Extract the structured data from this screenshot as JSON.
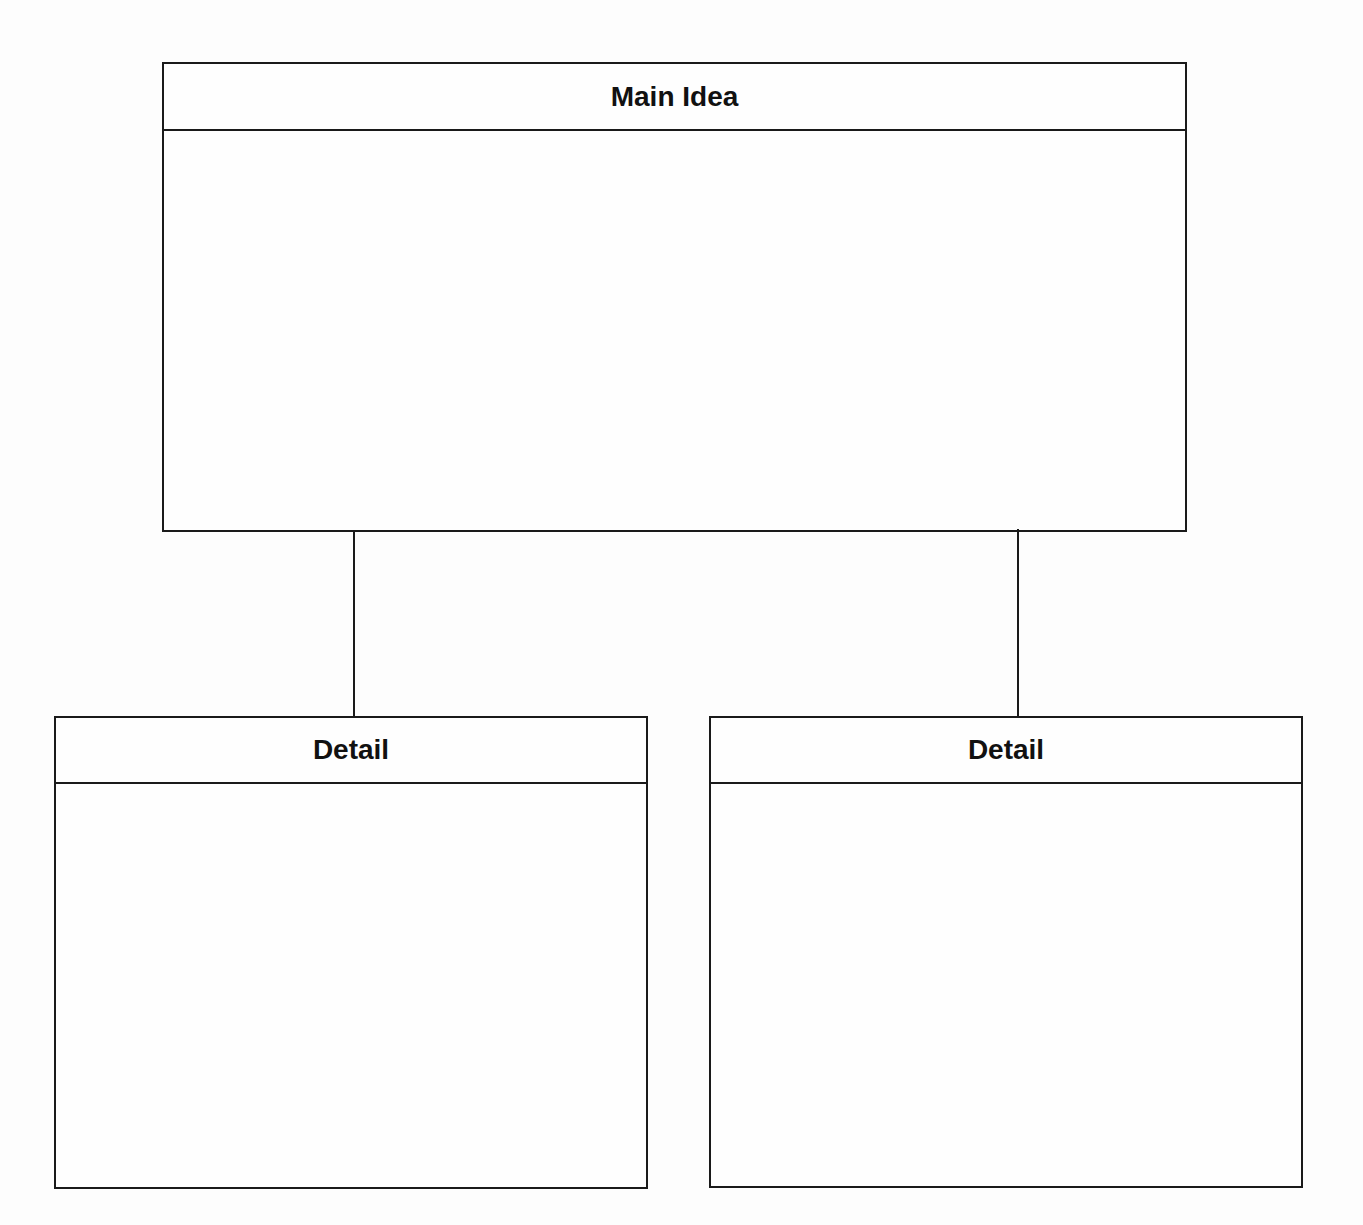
{
  "diagram": {
    "type": "hierarchy",
    "main": {
      "title": "Main Idea",
      "body": ""
    },
    "details": [
      {
        "title": "Detail",
        "body": ""
      },
      {
        "title": "Detail",
        "body": ""
      }
    ],
    "colors": {
      "stroke": "#1a1a1a",
      "background": "#fdfdfd",
      "text": "#111111"
    }
  }
}
